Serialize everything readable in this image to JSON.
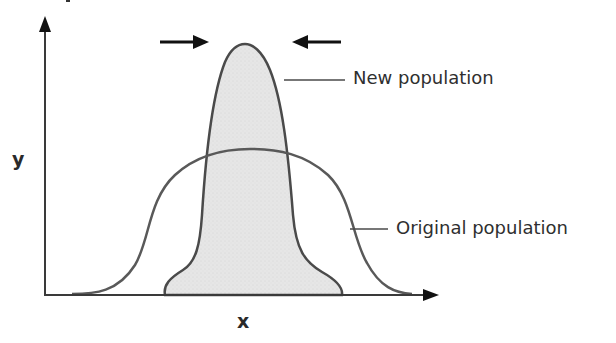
{
  "diagram": {
    "type": "distribution-shift",
    "axes": {
      "x_label": "x",
      "y_label": "y"
    },
    "curves": [
      {
        "id": "original",
        "label": "Original population",
        "fill": "none",
        "stroke": "#5a5a5a"
      },
      {
        "id": "new",
        "label": "New population",
        "fill": "#e4e4e4",
        "stroke": "#4a4a4a"
      }
    ],
    "arrows": [
      {
        "id": "arrow-right",
        "direction": "right"
      },
      {
        "id": "arrow-left",
        "direction": "left"
      }
    ],
    "colors": {
      "axis": "#3a3a3a",
      "arrow": "#111111",
      "leader_line": "#4a4a4a",
      "shade": "#e4e4e4"
    }
  },
  "labels": {
    "new_population": "New population",
    "original_population": "Original population",
    "x_axis": "x",
    "y_axis": "y"
  }
}
